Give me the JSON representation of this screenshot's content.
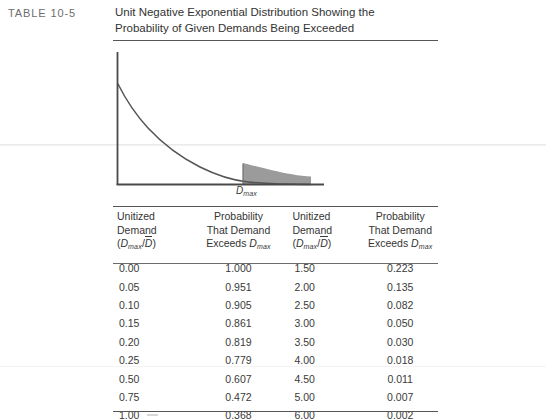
{
  "page": {
    "table_label": "TABLE 10-5",
    "caption_line1": "Unit Negative Exponential Distribution Showing the",
    "caption_line2": "Probability of Given Demands Being Exceeded"
  },
  "figure": {
    "axis_label_demand": "D",
    "axis_label_demand_sub": "max",
    "curve_color": "#555555",
    "shade_color": "#9a9a9a",
    "axis_color": "#4a4a4a"
  },
  "table": {
    "headers": [
      {
        "line1": "Unitized",
        "line2": "Demand",
        "line3_pre": "(",
        "line3_var": "D",
        "line3_sub": "max",
        "line3_mid": "/",
        "line3_bar": "D",
        "line3_post": ")"
      },
      {
        "line1": "Probability",
        "line2": "That Demand",
        "line3_pre": "Exceeds ",
        "line3_var": "D",
        "line3_sub": "max"
      },
      {
        "line1": "Unitized",
        "line2": "Demand",
        "line3_pre": "(",
        "line3_var": "D",
        "line3_sub": "max",
        "line3_mid": "/",
        "line3_bar": "D",
        "line3_post": ")"
      },
      {
        "line1": "Probability",
        "line2": "That Demand",
        "line3_pre": "Exceeds ",
        "line3_var": "D",
        "line3_sub": "max"
      }
    ],
    "rows": [
      {
        "c1": "0.00",
        "c2": "1.000",
        "c3": "1.50",
        "c4": "0.223"
      },
      {
        "c1": "0.05",
        "c2": "0.951",
        "c3": "2.00",
        "c4": "0.135"
      },
      {
        "c1": "0.10",
        "c2": "0.905",
        "c3": "2.50",
        "c4": "0.082"
      },
      {
        "c1": "0.15",
        "c2": "0.861",
        "c3": "3.00",
        "c4": "0.050"
      },
      {
        "c1": "0.20",
        "c2": "0.819",
        "c3": "3.50",
        "c4": "0.030"
      },
      {
        "c1": "0.25",
        "c2": "0.779",
        "c3": "4.00",
        "c4": "0.018"
      },
      {
        "c1": "0.50",
        "c2": "0.607",
        "c3": "4.50",
        "c4": "0.011"
      },
      {
        "c1": "0.75",
        "c2": "0.472",
        "c3": "5.00",
        "c4": "0.007"
      },
      {
        "c1": "1.00",
        "c2": "0.368",
        "c3": "6.00",
        "c4": "0.002"
      }
    ]
  },
  "chart_data": {
    "type": "line",
    "title": "Unit Negative Exponential Distribution Showing the Probability of Given Demands Being Exceeded",
    "xlabel": "",
    "ylabel": "",
    "x": [
      0.0,
      0.05,
      0.1,
      0.15,
      0.2,
      0.25,
      0.5,
      0.75,
      1.0,
      1.5,
      2.0,
      2.5,
      3.0,
      3.5,
      4.0,
      4.5,
      5.0,
      6.0
    ],
    "values": [
      1.0,
      0.951,
      0.905,
      0.861,
      0.819,
      0.779,
      0.607,
      0.472,
      0.368,
      0.223,
      0.135,
      0.082,
      0.05,
      0.03,
      0.018,
      0.011,
      0.007,
      0.002
    ],
    "series": [
      {
        "name": "Probability That Demand Exceeds Dmax",
        "values": [
          1.0,
          0.951,
          0.905,
          0.861,
          0.819,
          0.779,
          0.607,
          0.472,
          0.368,
          0.223,
          0.135,
          0.082,
          0.05,
          0.03,
          0.018,
          0.011,
          0.007,
          0.002
        ]
      }
    ],
    "annotations": [
      "Dmax"
    ],
    "shaded_region": {
      "from": 1.5,
      "to": 3.9,
      "label": "Probability that demand exceeds Dmax"
    },
    "grid": false,
    "legend": "none",
    "xlim": [
      0,
      5
    ],
    "ylim": [
      0,
      1
    ]
  }
}
